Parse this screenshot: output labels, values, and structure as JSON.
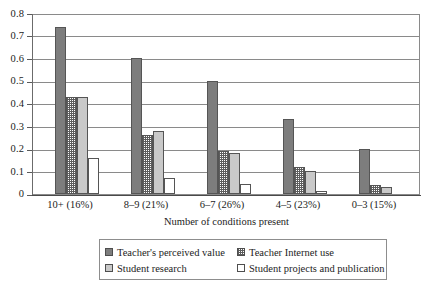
{
  "chart_data": {
    "type": "bar",
    "title": "",
    "xlabel": "Number of conditions present",
    "ylabel": "",
    "ylim": [
      0,
      0.8
    ],
    "ytick_labels": [
      "0.8",
      "0.7",
      "0.6",
      "0.5",
      "0.4",
      "0.3",
      "0.2",
      "0.1",
      "0"
    ],
    "ytick_values": [
      0.8,
      0.7,
      0.6,
      0.5,
      0.4,
      0.3,
      0.2,
      0.1,
      0
    ],
    "grid": true,
    "legend_position": "bottom",
    "categories": [
      "10+ (16%)",
      "8–9 (21%)",
      "6–7 (26%)",
      "4–5 (23%)",
      "0–3 (15%)"
    ],
    "series": [
      {
        "name": "Teacher's perceived value",
        "swatch": "dark-gray-solid",
        "values": [
          0.74,
          0.6,
          0.5,
          0.33,
          0.2
        ]
      },
      {
        "name": "Teacher Internet use",
        "swatch": "checkered",
        "values": [
          0.43,
          0.26,
          0.19,
          0.12,
          0.04
        ]
      },
      {
        "name": "Student research",
        "swatch": "light-gray-solid",
        "values": [
          0.43,
          0.28,
          0.18,
          0.1,
          0.03
        ]
      },
      {
        "name": "Student projects and publication",
        "swatch": "white-outline",
        "values": [
          0.16,
          0.07,
          0.045,
          0.015,
          0.0
        ]
      }
    ],
    "colors": {
      "series1_dark_gray": "#7d7d7d",
      "series2_checkered": "#5d5d5d",
      "series3_light_gray": "#c9c9c9",
      "series4_white": "#ffffff",
      "gridline": "#8a8a8a",
      "axis": "#4a4a4a",
      "text": "#1c1c1c"
    }
  },
  "legend": {
    "items": [
      {
        "label": "Teacher's perceived value",
        "swatch": "dark-gray-solid"
      },
      {
        "label": "Teacher Internet use",
        "swatch": "checkered"
      },
      {
        "label": "Student research",
        "swatch": "light-gray-solid"
      },
      {
        "label": "Student projects and publication",
        "swatch": "white-outline"
      }
    ]
  }
}
